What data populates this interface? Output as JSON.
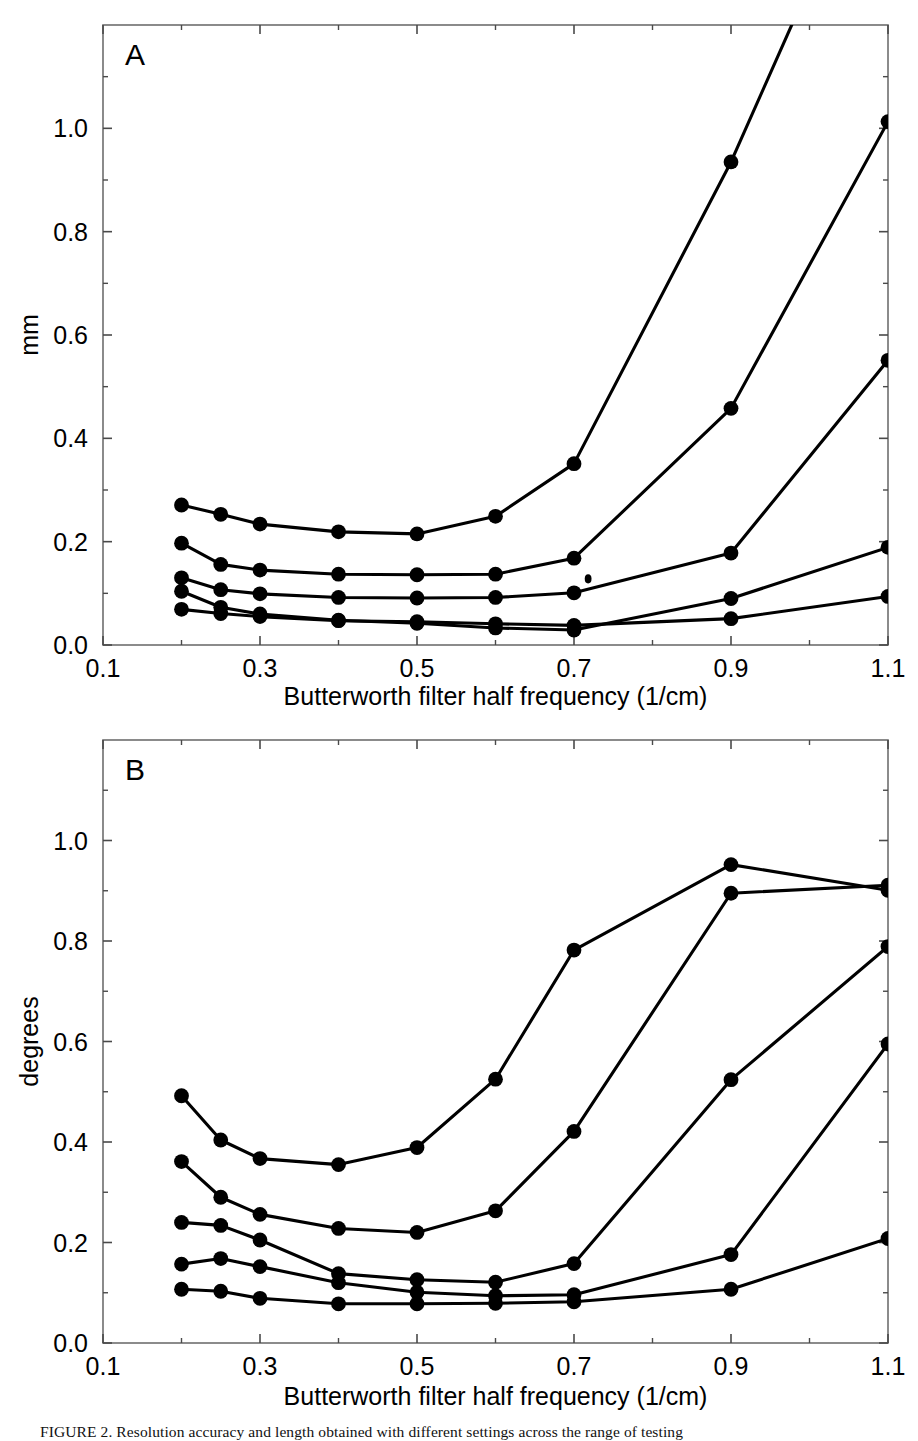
{
  "figure": {
    "caption": "FIGURE 2.   Resolution accuracy and  length  obtained with different  settings  across the  range  of  testing"
  },
  "chart_data": [
    {
      "id": "panel-a",
      "type": "line",
      "panel_label": "A",
      "title": "",
      "xlabel": "Butterworth filter half frequency (1/cm)",
      "ylabel": "mm",
      "xlim": [
        0.1,
        1.1
      ],
      "ylim": [
        0.0,
        1.2
      ],
      "xticks": [
        0.1,
        0.3,
        0.5,
        0.7,
        0.9,
        1.1
      ],
      "xticklabels": [
        "0.1",
        "0.3",
        "0.5",
        "0.7",
        "0.9",
        "1.1"
      ],
      "xminorticks": [
        0.2,
        0.4,
        0.6,
        0.8,
        1.0
      ],
      "yticks": [
        0.0,
        0.2,
        0.4,
        0.6,
        0.8,
        1.0
      ],
      "yticklabels": [
        "0.0",
        "0.2",
        "0.4",
        "0.6",
        "0.8",
        "1.0"
      ],
      "yminorticks": [
        0.1,
        0.3,
        0.5,
        0.7,
        0.9,
        1.1
      ],
      "grid": false,
      "legend": "none",
      "marker": "filled-circle",
      "line_color": "#000000",
      "x": [
        0.2,
        0.25,
        0.3,
        0.4,
        0.5,
        0.6,
        0.7,
        0.9,
        1.1
      ],
      "series": [
        {
          "name": "series-1",
          "values": [
            0.271,
            0.253,
            0.234,
            0.219,
            0.215,
            0.249,
            0.351,
            0.935,
            1.62
          ]
        },
        {
          "name": "series-2",
          "values": [
            0.197,
            0.156,
            0.145,
            0.137,
            0.136,
            0.137,
            0.168,
            0.458,
            1.013
          ]
        },
        {
          "name": "series-3",
          "values": [
            0.13,
            0.107,
            0.099,
            0.092,
            0.091,
            0.092,
            0.101,
            0.178,
            0.551
          ]
        },
        {
          "name": "series-4",
          "values": [
            0.104,
            0.073,
            0.06,
            0.048,
            0.042,
            0.033,
            0.029,
            0.09,
            0.189
          ]
        },
        {
          "name": "series-5",
          "values": [
            0.069,
            0.061,
            0.055,
            0.047,
            0.045,
            0.041,
            0.038,
            0.051,
            0.094
          ]
        }
      ],
      "artifacts": [
        {
          "name": "speck",
          "x": 0.718,
          "y": 0.128
        }
      ]
    },
    {
      "id": "panel-b",
      "type": "line",
      "panel_label": "B",
      "title": "",
      "xlabel": "Butterworth filter half frequency (1/cm)",
      "ylabel": "degrees",
      "xlim": [
        0.1,
        1.1
      ],
      "ylim": [
        0.0,
        1.2
      ],
      "xticks": [
        0.1,
        0.3,
        0.5,
        0.7,
        0.9,
        1.1
      ],
      "xticklabels": [
        "0.1",
        "0.3",
        "0.5",
        "0.7",
        "0.9",
        "1.1"
      ],
      "xminorticks": [
        0.2,
        0.4,
        0.6,
        0.8,
        1.0
      ],
      "yticks": [
        0.0,
        0.2,
        0.4,
        0.6,
        0.8,
        1.0
      ],
      "yticklabels": [
        "0.0",
        "0.2",
        "0.4",
        "0.6",
        "0.8",
        "1.0"
      ],
      "yminorticks": [
        0.1,
        0.3,
        0.5,
        0.7,
        0.9,
        1.1
      ],
      "grid": false,
      "legend": "none",
      "marker": "filled-circle",
      "line_color": "#000000",
      "x": [
        0.2,
        0.25,
        0.3,
        0.4,
        0.5,
        0.6,
        0.7,
        0.9,
        1.1
      ],
      "series": [
        {
          "name": "series-1",
          "values": [
            0.492,
            0.404,
            0.367,
            0.355,
            0.389,
            0.525,
            0.782,
            0.952,
            0.901
          ]
        },
        {
          "name": "series-2",
          "values": [
            0.361,
            0.29,
            0.256,
            0.228,
            0.22,
            0.263,
            0.421,
            0.895,
            0.911
          ]
        },
        {
          "name": "series-3",
          "values": [
            0.24,
            0.234,
            0.205,
            0.138,
            0.126,
            0.121,
            0.158,
            0.524,
            0.789
          ]
        },
        {
          "name": "series-4",
          "values": [
            0.157,
            0.168,
            0.152,
            0.12,
            0.101,
            0.094,
            0.096,
            0.176,
            0.595
          ]
        },
        {
          "name": "series-5",
          "values": [
            0.107,
            0.103,
            0.089,
            0.078,
            0.078,
            0.079,
            0.082,
            0.107,
            0.208
          ]
        }
      ]
    }
  ]
}
